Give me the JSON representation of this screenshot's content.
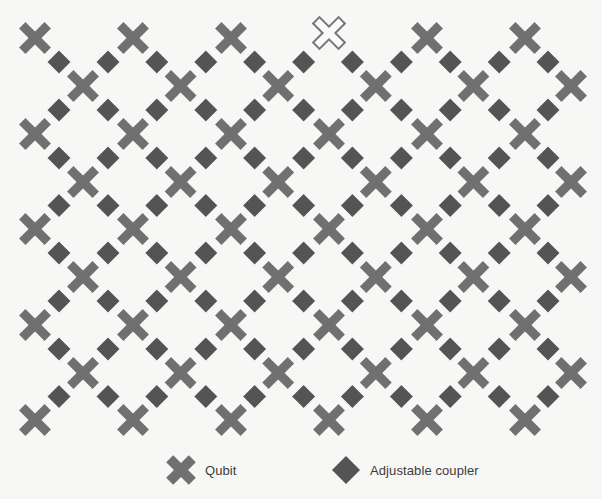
{
  "diagram": {
    "colors": {
      "background": "#f7f7f5",
      "qubit": "#707070",
      "coupler": "#545454",
      "defective_qubit_stroke": "#777777",
      "defective_qubit_fill": "#fafafa"
    },
    "qubit_geometry": {
      "arm_length": 18,
      "arm_width": 9
    },
    "coupler_geometry": {
      "half_diagonal": 12.5
    },
    "rows": [
      {
        "y": 38,
        "x_start": 35,
        "x_step": 98.0,
        "count": 6
      },
      {
        "y": 86,
        "x_start": 83,
        "x_step": 97.6,
        "count": 6
      },
      {
        "y": 134,
        "x_start": 35,
        "x_step": 98.0,
        "count": 6
      },
      {
        "y": 182,
        "x_start": 83,
        "x_step": 97.6,
        "count": 6
      },
      {
        "y": 229,
        "x_start": 35,
        "x_step": 98.0,
        "count": 6
      },
      {
        "y": 277,
        "x_start": 83,
        "x_step": 97.6,
        "count": 6
      },
      {
        "y": 325,
        "x_start": 35,
        "x_step": 98.0,
        "count": 6
      },
      {
        "y": 373,
        "x_start": 83,
        "x_step": 97.6,
        "count": 6
      },
      {
        "y": 420,
        "x_start": 35,
        "x_step": 98.0,
        "count": 6
      }
    ],
    "defective_qubits": [
      {
        "row": 0,
        "col": 3,
        "y_offset": -5
      }
    ]
  },
  "legend": {
    "items": [
      {
        "icon": "qubit-cross-icon",
        "label": "Qubit"
      },
      {
        "icon": "coupler-diamond-icon",
        "label": "Adjustable coupler"
      }
    ]
  }
}
